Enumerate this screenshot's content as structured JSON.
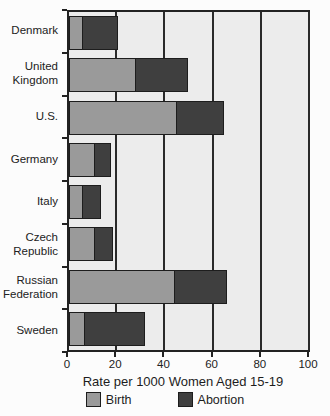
{
  "page": {
    "background": "#fcfcfc",
    "plot_background": "#ececec",
    "axis_color": "#222222"
  },
  "chart_data": {
    "type": "bar",
    "orientation": "horizontal",
    "stacked": true,
    "title": "",
    "xlabel": "Rate per 1000 Women Aged 15-19",
    "ylabel": "",
    "xlim": [
      0,
      100
    ],
    "xticks": [
      0,
      20,
      40,
      60,
      80,
      100
    ],
    "grid": "vertical",
    "legend_position": "bottom",
    "categories": [
      "Denmark",
      "United Kingdom",
      "U.S.",
      "Germany",
      "Italy",
      "Czech Republic",
      "Russian Federation",
      "Sweden"
    ],
    "series": [
      {
        "name": "Birth",
        "color": "#9a9a9a",
        "values": [
          6,
          28,
          45,
          11,
          6,
          11,
          44,
          7
        ]
      },
      {
        "name": "Abortion",
        "color": "#3f3f3f",
        "values": [
          15,
          22,
          20,
          7,
          8,
          8,
          22,
          25
        ]
      }
    ]
  }
}
